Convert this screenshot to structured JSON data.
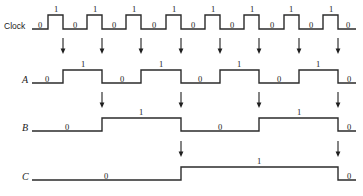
{
  "figure": {
    "width": 363,
    "height": 196,
    "background_color": "#ffffff",
    "wave_color": "#2b2b2b",
    "arrow_color": "#1f1f1f",
    "text_color": "#1a1a1a"
  },
  "axis": {
    "wave_start_x": 32,
    "wave_end_x": 356,
    "clock_period_px": 39.4,
    "clock_cycles": 8,
    "edge_positions_px": [
      63,
      102,
      141,
      181,
      220,
      259,
      299,
      338
    ]
  },
  "rows": [
    {
      "label": "Clock",
      "label_style": "sans",
      "label_x": 4,
      "baseline_y": 29,
      "low_y": 29,
      "high_y": 15,
      "level_label_y_low": 28,
      "level_label_y_high": 12,
      "transitions_px": [
        48,
        63,
        87,
        102,
        126,
        141,
        166,
        181,
        205,
        220,
        244,
        259,
        284,
        299,
        323,
        338
      ],
      "initial_level": 0,
      "bit_labels": [
        {
          "text": "0",
          "x": 40,
          "level": 0
        },
        {
          "text": "1",
          "x": 56,
          "level": 1
        },
        {
          "text": "0",
          "x": 75,
          "level": 0
        },
        {
          "text": "1",
          "x": 95,
          "level": 1
        },
        {
          "text": "0",
          "x": 114,
          "level": 0
        },
        {
          "text": "1",
          "x": 134,
          "level": 1
        },
        {
          "text": "0",
          "x": 154,
          "level": 0
        },
        {
          "text": "1",
          "x": 174,
          "level": 1
        },
        {
          "text": "0",
          "x": 193,
          "level": 0
        },
        {
          "text": "1",
          "x": 213,
          "level": 1
        },
        {
          "text": "0",
          "x": 232,
          "level": 0
        },
        {
          "text": "1",
          "x": 252,
          "level": 1
        },
        {
          "text": "0",
          "x": 272,
          "level": 0
        },
        {
          "text": "1",
          "x": 291,
          "level": 1
        },
        {
          "text": "0",
          "x": 311,
          "level": 0
        },
        {
          "text": "1",
          "x": 331,
          "level": 1
        },
        {
          "text": "0",
          "x": 348,
          "level": 0
        }
      ]
    },
    {
      "label": "A",
      "label_style": "italic",
      "label_x": 22,
      "baseline_y": 83,
      "low_y": 83,
      "high_y": 70,
      "level_label_y_low": 82,
      "level_label_y_high": 67,
      "transitions_px": [
        63,
        102,
        141,
        181,
        220,
        259,
        299,
        338
      ],
      "initial_level": 0,
      "bit_labels": [
        {
          "text": "0",
          "x": 47,
          "level": 0
        },
        {
          "text": "1",
          "x": 83,
          "level": 1
        },
        {
          "text": "0",
          "x": 122,
          "level": 0
        },
        {
          "text": "1",
          "x": 161,
          "level": 1
        },
        {
          "text": "0",
          "x": 200,
          "level": 0
        },
        {
          "text": "1",
          "x": 239,
          "level": 1
        },
        {
          "text": "0",
          "x": 279,
          "level": 0
        },
        {
          "text": "1",
          "x": 318,
          "level": 1
        },
        {
          "text": "0",
          "x": 349,
          "level": 0
        }
      ]
    },
    {
      "label": "B",
      "label_style": "italic",
      "label_x": 22,
      "baseline_y": 131,
      "low_y": 131,
      "high_y": 118,
      "level_label_y_low": 130,
      "level_label_y_high": 115,
      "transitions_px": [
        102,
        181,
        259,
        338
      ],
      "initial_level": 0,
      "bit_labels": [
        {
          "text": "0",
          "x": 67,
          "level": 0
        },
        {
          "text": "1",
          "x": 141,
          "level": 1
        },
        {
          "text": "0",
          "x": 220,
          "level": 0
        },
        {
          "text": "1",
          "x": 299,
          "level": 1
        },
        {
          "text": "0",
          "x": 349,
          "level": 0
        }
      ]
    },
    {
      "label": "C",
      "label_style": "italic",
      "label_x": 22,
      "baseline_y": 180,
      "low_y": 180,
      "high_y": 167,
      "level_label_y_low": 179,
      "level_label_y_high": 164,
      "transitions_px": [
        181,
        338
      ],
      "initial_level": 0,
      "bit_labels": [
        {
          "text": "0",
          "x": 106,
          "level": 0
        },
        {
          "text": "1",
          "x": 259,
          "level": 1
        },
        {
          "text": "0",
          "x": 349,
          "level": 0
        }
      ]
    }
  ],
  "arrow_groups": [
    {
      "name": "clock-to-a-arrows",
      "from_row": "Clock",
      "to_row": "A",
      "y_top": 38,
      "y_bottom": 54,
      "x_positions": [
        63,
        102,
        141,
        181,
        220,
        259,
        299,
        338
      ]
    },
    {
      "name": "a-to-b-arrows",
      "from_row": "A",
      "to_row": "B",
      "y_top": 92,
      "y_bottom": 108,
      "x_positions": [
        102,
        181,
        259,
        338
      ]
    },
    {
      "name": "b-to-c-arrows",
      "from_row": "B",
      "to_row": "C",
      "y_top": 141,
      "y_bottom": 157,
      "x_positions": [
        181,
        338
      ]
    }
  ],
  "chart_data": {
    "type": "line",
    "xlabel": "",
    "ylabel": "",
    "x": [
      0,
      1,
      2,
      3,
      4,
      5,
      6,
      7,
      8,
      9,
      10,
      11,
      12,
      13,
      14,
      15
    ],
    "x_unit": "clock half-cycle index",
    "series": [
      {
        "name": "Clock",
        "values": [
          0,
          1,
          0,
          1,
          0,
          1,
          0,
          1,
          0,
          1,
          0,
          1,
          0,
          1,
          0,
          1
        ],
        "toggles_on": "half-cycle"
      },
      {
        "name": "A",
        "values": [
          0,
          0,
          1,
          1,
          0,
          0,
          1,
          1,
          0,
          0,
          1,
          1,
          0,
          0,
          1,
          1
        ],
        "toggles_on": "clock falling edge"
      },
      {
        "name": "B",
        "values": [
          0,
          0,
          0,
          0,
          1,
          1,
          1,
          1,
          0,
          0,
          0,
          0,
          1,
          1,
          1,
          1
        ],
        "toggles_on": "A falling edge"
      },
      {
        "name": "C",
        "values": [
          0,
          0,
          0,
          0,
          0,
          0,
          0,
          0,
          1,
          1,
          1,
          1,
          1,
          1,
          1,
          1
        ],
        "toggles_on": "B falling edge"
      }
    ],
    "legend_position": "left-labels",
    "grid": false
  }
}
